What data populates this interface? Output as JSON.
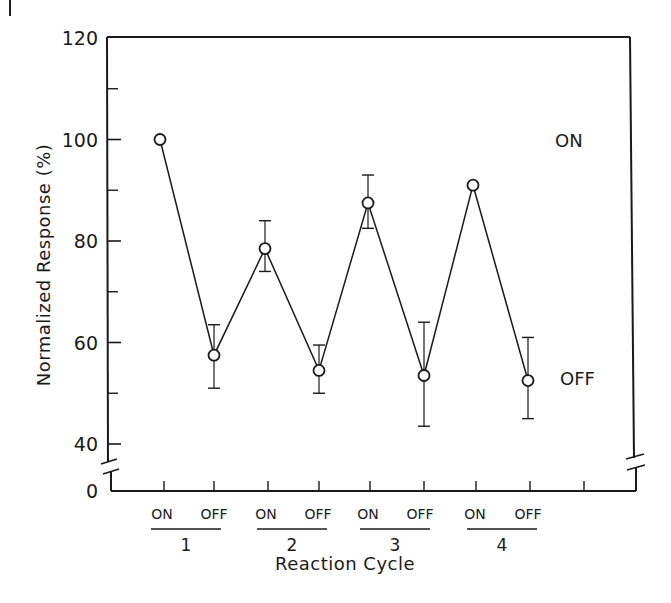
{
  "chart_data": {
    "type": "line",
    "title": "",
    "xlabel": "Reaction Cycle",
    "ylabel": "Normalized Response (%)",
    "ylim": [
      40,
      120
    ],
    "y_axis_break": true,
    "y_ticks": [
      {
        "value": 120,
        "label": "120"
      },
      {
        "value": 100,
        "label": "100"
      },
      {
        "value": 80,
        "label": "80"
      },
      {
        "value": 60,
        "label": "60"
      },
      {
        "value": 40,
        "label": "40"
      },
      {
        "value": 0,
        "label": "0"
      }
    ],
    "y_minor_ticks": [
      110,
      90,
      70,
      50
    ],
    "grid": false,
    "legend": null,
    "categories": [
      "ON",
      "OFF",
      "ON",
      "OFF",
      "ON",
      "OFF",
      "ON",
      "OFF"
    ],
    "groups": [
      {
        "label": "1",
        "members": [
          "ON",
          "OFF"
        ]
      },
      {
        "label": "2",
        "members": [
          "ON",
          "OFF"
        ]
      },
      {
        "label": "3",
        "members": [
          "ON",
          "OFF"
        ]
      },
      {
        "label": "4",
        "members": [
          "ON",
          "OFF"
        ]
      }
    ],
    "series": [
      {
        "name": "Normalized Response",
        "marker": "open-circle",
        "values": [
          100,
          57.5,
          78.5,
          54.5,
          87.5,
          53.5,
          91,
          52.5
        ],
        "error_upper": [
          null,
          63.5,
          84,
          59.5,
          93,
          64,
          null,
          61
        ],
        "error_lower": [
          null,
          51,
          74,
          50,
          82.5,
          43.5,
          null,
          45
        ]
      }
    ],
    "annotations": [
      {
        "text": "ON",
        "x_px": 555,
        "y_value": 100
      },
      {
        "text": "OFF",
        "x_px": 560,
        "y_value": 53
      }
    ],
    "corner_mark": "I"
  }
}
